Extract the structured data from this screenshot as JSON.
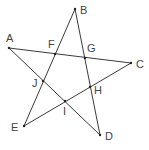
{
  "diagram": {
    "type": "pentagram",
    "line_color": "#3a3a3a",
    "label_color": "#444444",
    "vertices": [
      {
        "name": "A",
        "x": 9,
        "y": 48,
        "label_x": 6,
        "label_y": 42
      },
      {
        "name": "B",
        "x": 75,
        "y": 9,
        "label_x": 80,
        "label_y": 14
      },
      {
        "name": "C",
        "x": 131,
        "y": 63,
        "label_x": 136,
        "label_y": 68
      },
      {
        "name": "D",
        "x": 100,
        "y": 135,
        "label_x": 105,
        "label_y": 140
      },
      {
        "name": "E",
        "x": 24,
        "y": 126,
        "label_x": 11,
        "label_y": 131
      }
    ],
    "intersections": [
      {
        "name": "F",
        "x": 55,
        "y": 54,
        "label_x": 48,
        "label_y": 48
      },
      {
        "name": "G",
        "x": 85,
        "y": 58,
        "label_x": 87,
        "label_y": 52
      },
      {
        "name": "H",
        "x": 90,
        "y": 87,
        "label_x": 94,
        "label_y": 94
      },
      {
        "name": "I",
        "x": 65,
        "y": 101,
        "label_x": 63,
        "label_y": 115
      },
      {
        "name": "J",
        "x": 43,
        "y": 81,
        "label_x": 32,
        "label_y": 87
      }
    ],
    "edges": [
      [
        "A",
        "C"
      ],
      [
        "C",
        "E"
      ],
      [
        "E",
        "B"
      ],
      [
        "B",
        "D"
      ],
      [
        "D",
        "A"
      ]
    ]
  }
}
